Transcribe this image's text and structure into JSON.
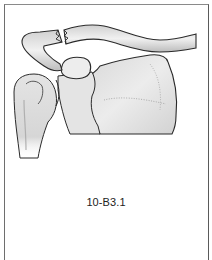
{
  "figure": {
    "label": "10-B3.1",
    "parts": [
      {
        "name": "clavicle-lateral-fragment"
      },
      {
        "name": "clavicle-medial-fragment"
      },
      {
        "name": "acromion"
      },
      {
        "name": "coracoid-process"
      },
      {
        "name": "humeral-head"
      },
      {
        "name": "scapula-body"
      }
    ]
  },
  "colors": {
    "outline": "#2a2a2a",
    "bone_fill": "#e6e6e6",
    "shade": "#bdbdbd",
    "frame": "#6e6e6e",
    "text": "#222222"
  }
}
